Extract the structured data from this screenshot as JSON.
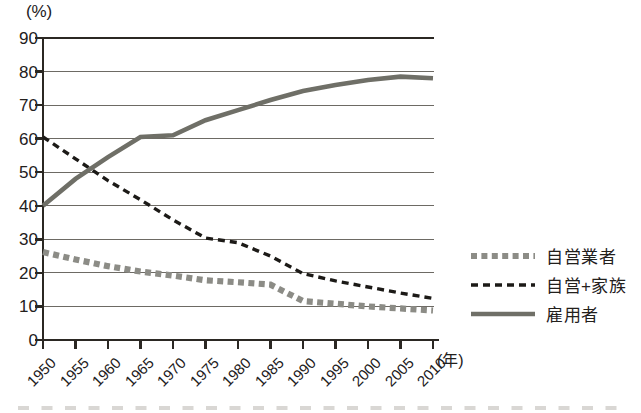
{
  "chart_data": {
    "type": "line",
    "title": "",
    "xlabel": "(年)",
    "ylabel": "(%)",
    "x": [
      1950,
      1955,
      1960,
      1965,
      1970,
      1975,
      1980,
      1985,
      1990,
      1995,
      2000,
      2005,
      2010
    ],
    "categories": [
      "1950",
      "1955",
      "1960",
      "1965",
      "1970",
      "1975",
      "1980",
      "1985",
      "1990",
      "1995",
      "2000",
      "2005",
      "2010"
    ],
    "xlim": [
      1950,
      2010
    ],
    "ylim": [
      0,
      90
    ],
    "yticks": [
      0,
      10,
      20,
      30,
      40,
      50,
      60,
      70,
      80,
      90
    ],
    "ytick_labels": [
      "0",
      "10",
      "20",
      "30",
      "40",
      "50",
      "60",
      "70",
      "80",
      "90"
    ],
    "grid": true,
    "grid_axis": "y",
    "legend_position": "right",
    "series": [
      {
        "name": "自営業者",
        "style": "dotted-thick",
        "color": "#8c8c86",
        "values": [
          26.2,
          24.0,
          22.0,
          20.4,
          19.2,
          17.8,
          17.2,
          16.5,
          11.6,
          10.8,
          10.0,
          9.4,
          8.8
        ]
      },
      {
        "name": "自営+家族",
        "style": "dashed",
        "color": "#1c1a17",
        "values": [
          60.5,
          54.0,
          47.5,
          41.8,
          35.8,
          30.4,
          29.0,
          25.0,
          19.8,
          17.6,
          15.8,
          14.0,
          12.4
        ]
      },
      {
        "name": "雇用者",
        "style": "solid-thick",
        "color": "#6f6f67",
        "values": [
          40.0,
          48.0,
          54.5,
          60.5,
          61.0,
          65.5,
          68.5,
          71.5,
          74.2,
          76.0,
          77.5,
          78.5,
          78.0
        ]
      }
    ]
  },
  "legend": {
    "items": [
      {
        "label": "自営業者"
      },
      {
        "label": "自営+家族"
      },
      {
        "label": "雇用者"
      }
    ]
  },
  "axes": {
    "y_unit": "(%)",
    "x_unit": "(年)"
  }
}
